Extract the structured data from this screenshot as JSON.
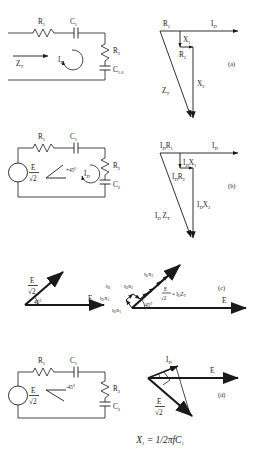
{
  "figure": {
    "equation": {
      "lhs": "X",
      "lhs_sub": "1",
      "rhs": "= 1/2πfC",
      "rhs_sub": "1"
    },
    "panels": [
      {
        "id": "a",
        "label": "(a)",
        "circuit": {
          "components": [
            {
              "name": "R",
              "sub": "1",
              "type": "resistor"
            },
            {
              "name": "C",
              "sub": "1",
              "type": "capacitor"
            },
            {
              "name": "R",
              "sub": "2",
              "type": "resistor"
            },
            {
              "name": "C",
              "sub": "2",
              "type": "capacitor"
            }
          ],
          "input_label": "Z",
          "input_sub": "T",
          "loop_label": "I",
          "loop_sub": "D",
          "source": null
        },
        "phasor": {
          "vectors": [
            {
              "name": "R",
              "sub": "1"
            },
            {
              "name": "I",
              "sub": "D"
            },
            {
              "name": "X",
              "sub": "1"
            },
            {
              "name": "R",
              "sub": "2"
            },
            {
              "name": "X",
              "sub": "2"
            },
            {
              "name": "Z",
              "sub": "T"
            }
          ]
        }
      },
      {
        "id": "b",
        "label": "(b)",
        "circuit": {
          "components": [
            {
              "name": "R",
              "sub": "1",
              "type": "resistor"
            },
            {
              "name": "C",
              "sub": "1",
              "type": "capacitor"
            },
            {
              "name": "R",
              "sub": "2",
              "type": "resistor"
            },
            {
              "name": "C",
              "sub": "2",
              "type": "capacitor"
            }
          ],
          "input_label": null,
          "loop_label": "I",
          "loop_sub": "D",
          "source": {
            "num": "E",
            "den": "√2",
            "angle": "+45°"
          }
        },
        "phasor": {
          "vectors": [
            {
              "name": "I₀R",
              "sub": "1",
              "text": "I R"
            },
            {
              "name": "I",
              "sub": "D"
            },
            {
              "name": "I₀X",
              "sub": "1",
              "text": "I X"
            },
            {
              "name": "I₀R",
              "sub": "2",
              "text": "I R"
            },
            {
              "name": "I₀X",
              "sub": "2",
              "text": "I X"
            },
            {
              "name": "I₀Z",
              "sub": "T",
              "text": "I Z"
            }
          ]
        }
      },
      {
        "id": "c",
        "label": "(c)",
        "left_diagram": {
          "source_num": "E",
          "source_den": "√2",
          "angle": "45°",
          "reference": "E"
        },
        "right_diagram": {
          "angle": "45°",
          "reference": "E",
          "resultant_num": "E",
          "resultant_den": "√2",
          "resultant_eq": "= I",
          "resultant_eq_sub": "D",
          "resultant_eq_tail": "Z",
          "resultant_eq_tail_sub": "T",
          "vectors": [
            {
              "text": "I",
              "sub": "D"
            },
            {
              "text": "I X",
              "sub_a": "D",
              "sub_b": "1"
            },
            {
              "text": "I R",
              "sub_a": "D",
              "sub_b": "2"
            },
            {
              "text": "I X",
              "sub_a": "D",
              "sub_b": "2"
            },
            {
              "text": "I R",
              "sub_a": "D",
              "sub_b": "1"
            }
          ]
        }
      },
      {
        "id": "d",
        "label": "(d)",
        "circuit": {
          "components": [
            {
              "name": "R",
              "sub": "1",
              "type": "resistor"
            },
            {
              "name": "C",
              "sub": "1",
              "type": "capacitor"
            },
            {
              "name": "R",
              "sub": "2",
              "type": "resistor"
            },
            {
              "name": "C",
              "sub": "2",
              "type": "capacitor"
            }
          ],
          "input_label": null,
          "loop_label": null,
          "source": {
            "num": "E",
            "den": "√2",
            "angle": "-45°"
          }
        },
        "phasor": {
          "vectors": [
            {
              "name": "I",
              "sub": "D"
            },
            {
              "name": "E",
              "sub": ""
            },
            {
              "name": "E/√2",
              "sub": ""
            }
          ],
          "source_num": "E",
          "source_den": "√2",
          "reference": "E",
          "current": "I",
          "current_sub": "D"
        }
      }
    ]
  }
}
